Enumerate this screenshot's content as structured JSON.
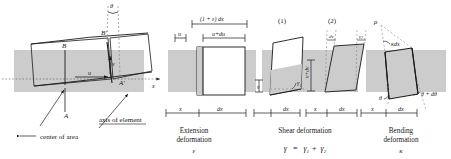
{
  "figure": {
    "background_color": "#ffffff",
    "shade_color": "#cccccc",
    "line_color": "#1a1a1a",
    "dash_color": "#8a8a8a"
  },
  "main_panel": {
    "labels": {
      "theta": "θ",
      "point_A": "A",
      "point_A_prime": "A′",
      "point_B": "B",
      "point_B_prime": "B′",
      "disp_u": "u",
      "disp_v": "v",
      "axis_x": "x",
      "callout_center": "center of area",
      "callout_axis": "axis of element"
    }
  },
  "extension_panel": {
    "dim_top": "(1 + ε) dx",
    "dim_u_du": "u+du",
    "dim_u": "u",
    "base_x": "x",
    "base_dx": "dx",
    "caption_line1": "Extension",
    "caption_line2": "deformation",
    "symbol": "ε"
  },
  "shear_panel": {
    "part1_number": "(1)",
    "part2_number": "(2)",
    "gamma1": "γ",
    "gamma1_sub": "1",
    "gamma2": "γ",
    "gamma2_sub": "2",
    "label_v": "v",
    "label_v_dv": "v+dv",
    "label_dv": "dv",
    "base_x_1": "x",
    "base_dx_1": "dx",
    "base_x_2": "x",
    "base_dx_2": "dx",
    "caption": "Shear deformation",
    "formula": "γ  =  γ₁+ γ₂",
    "formula_lead": "γ",
    "formula_eq": "=",
    "formula_t1": "γ",
    "formula_t1_sub": "1",
    "formula_plus": "+",
    "formula_t2": "γ",
    "formula_t2_sub": "2"
  },
  "bending_panel": {
    "rho": "ρ",
    "kappa_dx": "κdx",
    "theta": "θ",
    "theta_d_theta": "θ + dθ",
    "base_x": "x",
    "base_dx": "dx",
    "caption_line1": "Bending",
    "caption_line2": "deformation",
    "symbol": "κ"
  }
}
